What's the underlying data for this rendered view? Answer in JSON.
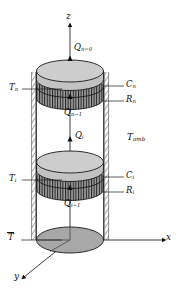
{
  "figure": {
    "type": "thermal-network-cylinder-schematic"
  },
  "axes": {
    "z": "z",
    "x": "x",
    "y": "y"
  },
  "heat_flux_labels": {
    "top": {
      "base": "Q",
      "sub": "n=0"
    },
    "upper_lower": {
      "base": "Q",
      "sub": "n−1"
    },
    "middle": {
      "base": "Q",
      "sub": "i"
    },
    "lower": {
      "base": "Q",
      "sub": "i−1"
    }
  },
  "temperature_labels": {
    "upper_node": {
      "base": "T",
      "sub": "n"
    },
    "middle_node": {
      "base": "T",
      "sub": "i"
    },
    "base_node": {
      "base": "T",
      "sub": "",
      "overbar": true
    },
    "ambient": {
      "base": "T",
      "sub": "amb"
    }
  },
  "capacitance_labels": {
    "upper": {
      "base": "C",
      "sub": "n"
    },
    "middle": {
      "base": "C",
      "sub": "i"
    }
  },
  "resistance_labels": {
    "upper": {
      "base": "R",
      "sub": "n"
    },
    "middle": {
      "base": "R",
      "sub": "i"
    }
  },
  "colors": {
    "disk_light": "#c9c9c9",
    "disk_mid": "#b5b5b5",
    "disk_dark": "#a0a0a0",
    "hatch_stroke": "#2a2a2a",
    "outline": "#1a1a1a",
    "insulation": "#9a9a9a",
    "background": "#ffffff"
  }
}
